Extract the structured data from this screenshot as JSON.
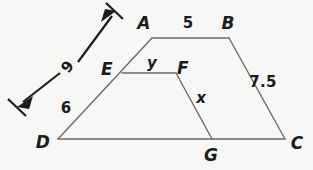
{
  "figure": {
    "kind": "geometry-diagram",
    "background_color": "#f7f7f5",
    "shape_stroke_color": "#6b6b6b",
    "dimension_stroke_color": "#1c1c1c",
    "label_color": "#1c1c1c",
    "vertices": [
      {
        "name": "A",
        "label": "A",
        "label_x": 144,
        "label_y": 23,
        "px": 152,
        "py": 38
      },
      {
        "name": "B",
        "label": "B",
        "label_x": 228,
        "label_y": 23,
        "px": 229,
        "py": 38
      },
      {
        "name": "C",
        "label": "C",
        "label_x": 297,
        "label_y": 143,
        "px": 285,
        "py": 139
      },
      {
        "name": "D",
        "label": "D",
        "label_x": 43,
        "label_y": 142,
        "px": 58,
        "py": 139
      },
      {
        "name": "E",
        "label": "E",
        "label_x": 107,
        "label_y": 69,
        "px": 122,
        "py": 73
      },
      {
        "name": "F",
        "label": "F",
        "label_x": 183,
        "label_y": 68,
        "px": 176,
        "py": 73
      },
      {
        "name": "G",
        "label": "G",
        "label_x": 211,
        "label_y": 155,
        "px": 212,
        "py": 139
      }
    ],
    "segment_labels": [
      {
        "name": "AB",
        "text": "5",
        "x": 188,
        "y": 23,
        "kind": "number"
      },
      {
        "name": "BC",
        "text": "7.5",
        "x": 263,
        "y": 82,
        "kind": "number"
      },
      {
        "name": "DE",
        "text": "6",
        "x": 66,
        "y": 108,
        "kind": "number"
      },
      {
        "name": "EF",
        "text": "y",
        "x": 152,
        "y": 63,
        "kind": "variable"
      },
      {
        "name": "FG",
        "text": "x",
        "x": 201,
        "y": 98,
        "kind": "variable"
      }
    ],
    "dimension": {
      "name": "DA",
      "text": "9",
      "x": 68,
      "y": 67,
      "rotation_deg": -52,
      "from_x": 20,
      "from_y": 105,
      "to_x": 115,
      "to_y": 13,
      "double_headed": true,
      "has_end_ticks": true
    }
  }
}
